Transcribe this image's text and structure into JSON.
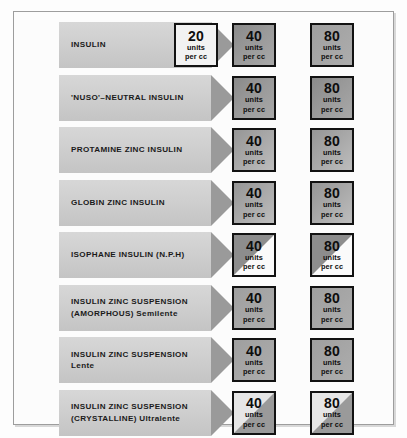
{
  "chart_data": {
    "type": "table",
    "columns": [
      "preparation",
      "20 units per cc",
      "40 units per cc",
      "80 units per cc"
    ],
    "rows": [
      {
        "preparation": "INSULIN",
        "strengths": [
          20,
          40,
          80
        ]
      },
      {
        "preparation": "'NUSO'–NEUTRAL INSULIN",
        "strengths": [
          40,
          80
        ]
      },
      {
        "preparation": "PROTAMINE ZINC INSULIN",
        "strengths": [
          40,
          80
        ]
      },
      {
        "preparation": "GLOBIN ZINC INSULIN",
        "strengths": [
          40,
          80
        ]
      },
      {
        "preparation": "ISOPHANE INSULIN (N.P.H)",
        "strengths": [
          40,
          80
        ]
      },
      {
        "preparation": "INSULIN ZINC SUSPENSION (AMORPHOUS) Semilente",
        "strengths": [
          40,
          80
        ]
      },
      {
        "preparation": "INSULIN ZINC SUSPENSION Lente",
        "strengths": [
          40,
          80
        ]
      },
      {
        "preparation": "INSULIN ZINC SUSPENSION (CRYSTALLINE) Ultralente",
        "strengths": [
          40,
          80
        ]
      }
    ],
    "units_label": "units per cc"
  },
  "units": {
    "line1": "units",
    "line2": "per cc"
  },
  "colors": {
    "banner_body": "#d0d0d0",
    "banner_head": "#9a9a9a",
    "box_border": "#121212",
    "box_gray": "#a6a6a6",
    "box_white": "#f2f2f2",
    "frame": "#9d9d9d",
    "page_background": "#fdfdfd",
    "text": "#1a1a1a"
  },
  "rows": [
    {
      "label_line1": "INSULIN",
      "label_line2": "",
      "boxes": [
        {
          "value": "20",
          "fill": "f-white",
          "col": "col20"
        },
        {
          "value": "40",
          "fill": "f-gray-d",
          "col": "col40b"
        },
        {
          "value": "80",
          "fill": "f-gray",
          "col": "col80"
        }
      ]
    },
    {
      "label_line1": "'NUSO'–NEUTRAL INSULIN",
      "label_line2": "",
      "boxes": [
        {
          "value": "40",
          "fill": "f-gray-d",
          "col": "col40"
        },
        {
          "value": "80",
          "fill": "f-gray-d",
          "col": "col80"
        }
      ]
    },
    {
      "label_line1": "PROTAMINE ZINC INSULIN",
      "label_line2": "",
      "boxes": [
        {
          "value": "40",
          "fill": "f-gray-l",
          "col": "col40"
        },
        {
          "value": "80",
          "fill": "f-gray-l",
          "col": "col80"
        }
      ]
    },
    {
      "label_line1": "GLOBIN ZINC INSULIN",
      "label_line2": "",
      "boxes": [
        {
          "value": "40",
          "fill": "f-gray-l",
          "col": "col40"
        },
        {
          "value": "80",
          "fill": "f-gray-l",
          "col": "col80"
        }
      ]
    },
    {
      "label_line1": "ISOPHANE INSULIN (N.P.H)",
      "label_line2": "",
      "boxes": [
        {
          "value": "40",
          "fill": "f-split-dark",
          "col": "col40"
        },
        {
          "value": "80",
          "fill": "f-split-dark",
          "col": "col80"
        }
      ]
    },
    {
      "label_line1": "INSULIN ZINC SUSPENSION",
      "label_line2": "(AMORPHOUS) Semilente",
      "boxes": [
        {
          "value": "40",
          "fill": "f-gray",
          "col": "col40"
        },
        {
          "value": "80",
          "fill": "f-gray",
          "col": "col80"
        }
      ]
    },
    {
      "label_line1": "INSULIN ZINC SUSPENSION",
      "label_line2": "Lente",
      "boxes": [
        {
          "value": "40",
          "fill": "f-gray",
          "col": "col40"
        },
        {
          "value": "80",
          "fill": "f-gray",
          "col": "col80"
        }
      ]
    },
    {
      "label_line1": "INSULIN ZINC SUSPENSION",
      "label_line2": "(CRYSTALLINE) Ultralente",
      "boxes": [
        {
          "value": "40",
          "fill": "f-split-light",
          "col": "col40"
        },
        {
          "value": "80",
          "fill": "f-split-light",
          "col": "col80"
        }
      ]
    }
  ]
}
